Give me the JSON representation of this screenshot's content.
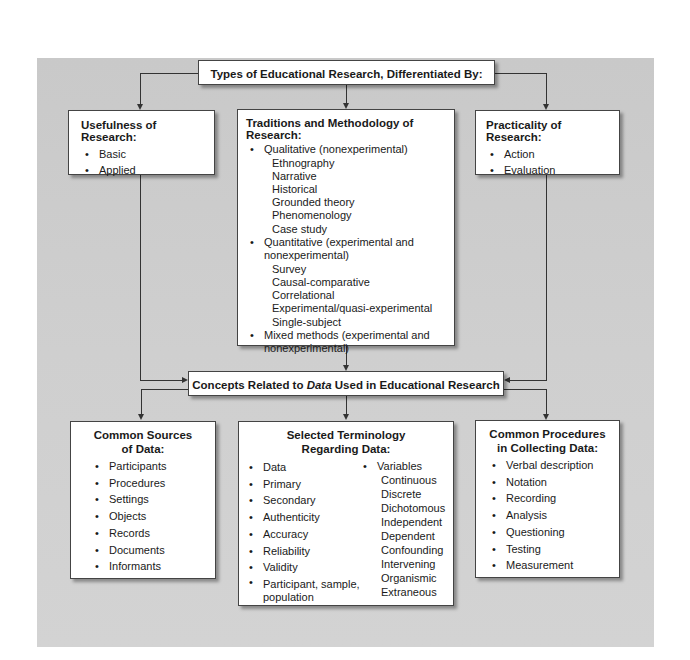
{
  "top": {
    "title": "Types of Educational Research, Differentiated By:"
  },
  "usefulness": {
    "title": "Usefulness of Research:",
    "items": [
      "Basic",
      "Applied"
    ]
  },
  "traditions": {
    "title": "Traditions and Methodology of Research:",
    "groups": [
      {
        "label": "Qualitative (nonexperimental)",
        "subitems": [
          "Ethnography",
          "Narrative",
          "Historical",
          "Grounded theory",
          "Phenomenology",
          "Case study"
        ]
      },
      {
        "label": "Quantitative (experimental and",
        "label_cont": "nonexperimental)",
        "subitems": [
          "Survey",
          "Causal-comparative",
          "Correlational",
          "Experimental/quasi-experimental",
          "Single-subject"
        ]
      },
      {
        "label": "Mixed methods (experimental and",
        "label_cont": "nonexperimental)",
        "subitems": []
      }
    ]
  },
  "practicality": {
    "title": "Practicality of Research:",
    "items": [
      "Action",
      "Evaluation"
    ]
  },
  "concepts": {
    "title_before": "Concepts Related to ",
    "title_italic": "Data",
    "title_after": " Used in Educational Research"
  },
  "sources": {
    "title_line1": "Common Sources",
    "title_line2": "of Data:",
    "items": [
      "Participants",
      "Procedures",
      "Settings",
      "Objects",
      "Records",
      "Documents",
      "Informants"
    ]
  },
  "terminology": {
    "title_line1": "Selected Terminology",
    "title_line2": "Regarding Data:",
    "left_items": [
      "Data",
      "Primary",
      "Secondary",
      "Authenticity",
      "Accuracy",
      "Reliability",
      "Validity",
      "Participant, sample,"
    ],
    "left_last_cont": "population",
    "variables_label": "Variables",
    "variables": [
      "Continuous",
      "Discrete",
      "Dichotomous",
      "Independent",
      "Dependent",
      "Confounding",
      "Intervening",
      "Organismic",
      "Extraneous"
    ]
  },
  "procedures": {
    "title_line1": "Common Procedures",
    "title_line2": "in Collecting Data:",
    "items": [
      "Verbal description",
      "Notation",
      "Recording",
      "Analysis",
      "Questioning",
      "Testing",
      "Measurement"
    ]
  },
  "colors": {
    "panel": "#cccccc",
    "box": "#ffffff",
    "line": "#333333"
  }
}
